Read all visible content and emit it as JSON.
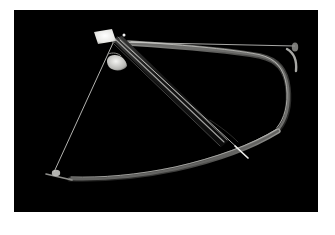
{
  "image": {
    "kind": "photograph",
    "subject": "compound crossbow",
    "orientation": "landscape",
    "width_px": 335,
    "height_px": 235,
    "background_color": "#000000",
    "frame_color": "#ffffff",
    "lighting": "low-key studio, single highlight",
    "caption": ""
  },
  "frame": {
    "border_left_px": 14,
    "border_top_px": 10,
    "border_right_px": 17,
    "border_bottom_px": 23,
    "photo_left_px": 14,
    "photo_top_px": 10,
    "photo_width_px": 304,
    "photo_height_px": 202
  },
  "palette": {
    "background": "#000000",
    "frame": "#ffffff",
    "highlight_bright": "#f2f2f0",
    "highlight_mid": "#a9a9a6",
    "highlight_dim": "#6e6e6c",
    "highlight_faint": "#3c3c3b",
    "string": "#c9c9c6",
    "limb_core": "#5a5a58",
    "rail_edge": "#8f8f8d"
  },
  "subject_parts": [
    {
      "id": "sight-block",
      "label": "Sight / stock plate",
      "note": "bright white quadrilateral, upper left"
    },
    {
      "id": "trigger-guard",
      "label": "Trigger guard",
      "note": "bright crescent below sight block"
    },
    {
      "id": "rail",
      "label": "Barrel rail",
      "note": "diagonal beam, upper-left to lower-right"
    },
    {
      "id": "bolt",
      "label": "Bolt / arrow",
      "note": "thin shaft along rail, tip lower-right"
    },
    {
      "id": "limb-upper",
      "label": "Upper limb",
      "note": "S-curve sweeping to right edge"
    },
    {
      "id": "limb-lower",
      "label": "Lower limb",
      "note": "S-curve sweeping to lower left"
    },
    {
      "id": "string-upper",
      "label": "Upper bowstring",
      "note": "taut line to right limb tip"
    },
    {
      "id": "string-lower",
      "label": "Lower bowstring",
      "note": "taut line to lower limb tip"
    }
  ],
  "geometry": {
    "sight_block": {
      "points": "80,22 97,20 101,31 84,34",
      "fill": "#f2f2f0"
    },
    "sight_spark": {
      "cx": 110,
      "cy": 25,
      "r": 1.6,
      "fill": "#ffffff"
    },
    "trigger_guard": {
      "path": "M 97,46 C 104,44 111,48 112,56 C 109,60 101,61 96,57 C 93,53 93,48 97,46 Z",
      "fill": "#d9d9d6"
    },
    "rail_body": {
      "path": "M 99,30 L 107,28 L 214,129 L 208,135 Z",
      "fill": "#1b1b1b"
    },
    "rail_edges": [
      {
        "d": "M 101,30 L 209,132",
        "stroke": "#9a9a98",
        "width": 1.1
      },
      {
        "d": "M 104,28 L 212,130",
        "stroke": "#7c7c7a",
        "width": 0.9
      },
      {
        "d": "M 100,33 L 206,136",
        "stroke": "#545452",
        "width": 0.8
      }
    ],
    "bolt_shaft": {
      "d": "M 106,31 L 228,142",
      "stroke": "#b8b8b5",
      "width": 0.9
    },
    "bolt_tip": {
      "d": "M 222,137 L 233,147",
      "stroke": "#e8e8e6",
      "width": 1.6
    },
    "limb_upper": {
      "d": "M 114,33 C 160,36 215,40 246,46 C 264,50 272,60 274,78 C 276,96 272,110 264,120",
      "stroke": "#6a6a68",
      "width": 3.2
    },
    "limb_upper_gloss": {
      "d": "M 118,32 C 162,35 214,39 245,45 C 262,49 270,59 272,77 C 274,95 270,109 263,118",
      "stroke": "#b4b4b1",
      "width": 1.1
    },
    "limb_lower": {
      "d": "M 262,122 C 236,137 200,150 160,159 C 122,167 86,170 56,169",
      "stroke": "#5e5e5c",
      "width": 3.0
    },
    "limb_lower_gloss": {
      "d": "M 261,120 C 235,135 199,148 159,157 C 121,165 86,168 57,167",
      "stroke": "#a6a6a3",
      "width": 1.0
    },
    "limb_tip_upper": {
      "d": "M 274,40 C 280,44 282,52 281,60",
      "stroke": "#9c9c99",
      "width": 2.0
    },
    "limb_tip_lower": {
      "d": "M 46,168 L 56,170",
      "stroke": "#cfcfcc",
      "width": 2.0
    },
    "string_upper": {
      "d": "M 98,32 L 281,36",
      "stroke": "#cdcdca",
      "width": 0.8
    },
    "string_lower": {
      "d": "M 99,33 L 40,162",
      "stroke": "#c4c4c1",
      "width": 0.9
    },
    "cam_upper": {
      "cx": 281,
      "cy": 37,
      "rx": 3.5,
      "ry": 5.0,
      "fill": "#8a8a87"
    },
    "cam_lower": {
      "cx": 43,
      "cy": 163,
      "rx": 4.0,
      "ry": 3.0,
      "fill": "#b0b0ad"
    }
  },
  "chart_data": null
}
